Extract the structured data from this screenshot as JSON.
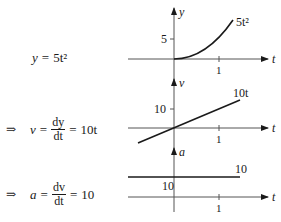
{
  "equations": [
    {
      "prefix": "",
      "lhs": "y",
      "eq": "=",
      "rhs": "5t²"
    },
    {
      "prefix": "⇒",
      "lhs": "v",
      "eq": "=",
      "frac_num": "dy",
      "frac_den": "dt",
      "eq2": "=",
      "rhs": "10t"
    },
    {
      "prefix": "⇒",
      "lhs": "a",
      "eq": "=",
      "frac_num": "dv",
      "frac_den": "dt",
      "eq2": "=",
      "rhs": "10"
    }
  ],
  "graphs": [
    {
      "y_axis_label": "y",
      "x_axis_label": "t",
      "y_tick_label": "5",
      "x_tick_label": "1",
      "curve_label": "5t²"
    },
    {
      "y_axis_label": "v",
      "x_axis_label": "t",
      "y_tick_label": "10",
      "x_tick_label": "1",
      "curve_label": "10t"
    },
    {
      "y_axis_label": "a",
      "x_axis_label": "t",
      "y_tick_label": "10",
      "x_tick_label": "1",
      "curve_label": "10"
    }
  ],
  "colors": {
    "ink": "#1a1a1a",
    "axis": "#555555"
  }
}
